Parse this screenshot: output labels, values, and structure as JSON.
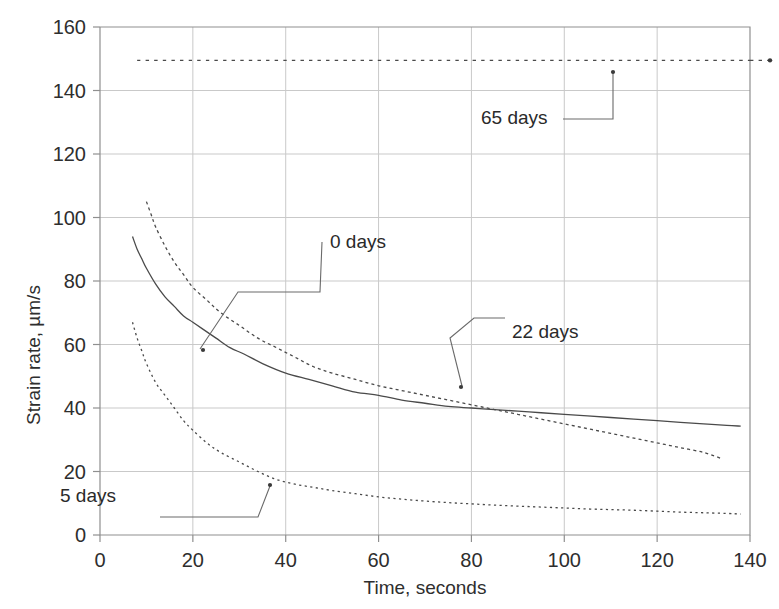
{
  "chart_data": {
    "type": "line",
    "title": "",
    "xlabel": "Time, seconds",
    "ylabel": "Strain rate, µm/s",
    "xlim": [
      0,
      140
    ],
    "ylim": [
      0,
      160
    ],
    "xticks": [
      0,
      20,
      40,
      60,
      80,
      100,
      120,
      140
    ],
    "yticks": [
      0,
      20,
      40,
      60,
      80,
      100,
      120,
      140,
      160
    ],
    "grid": true,
    "legend": "inline-annotations",
    "series": [
      {
        "name": "0 days",
        "style": "solid",
        "x": [
          7,
          8,
          9,
          10,
          12,
          14,
          16,
          18,
          20,
          22,
          25,
          28,
          31,
          35,
          40,
          45,
          50,
          55,
          60,
          65,
          70,
          75,
          80,
          85,
          90,
          95,
          100,
          105,
          110,
          115,
          120,
          125,
          130,
          135,
          138
        ],
        "y": [
          94,
          90,
          87,
          84,
          79,
          75,
          72,
          69,
          67,
          65,
          62,
          59,
          57,
          54,
          51,
          49,
          47,
          45,
          44,
          42.5,
          41.5,
          40.5,
          40,
          39.5,
          39,
          38.5,
          38,
          37.5,
          37,
          36.5,
          36,
          35.5,
          35,
          34.5,
          34.3
        ]
      },
      {
        "name": "22 days",
        "style": "dashed",
        "x": [
          10,
          11,
          12,
          14,
          16,
          18,
          20,
          23,
          26,
          30,
          34,
          38,
          42,
          46,
          50,
          55,
          60,
          65,
          70,
          75,
          80,
          85,
          90,
          95,
          100,
          105,
          110,
          115,
          120,
          125,
          130,
          134
        ],
        "y": [
          105,
          101,
          97,
          91,
          86,
          82,
          78,
          74,
          70,
          66,
          62,
          59,
          56,
          53,
          51,
          49,
          47,
          45.5,
          44,
          42.5,
          41,
          39.5,
          38,
          36.5,
          35,
          33.5,
          32,
          30.5,
          29,
          27.5,
          26,
          24
        ]
      },
      {
        "name": "5 days",
        "style": "dotted",
        "x": [
          7,
          8,
          9,
          10,
          12,
          14,
          16,
          18,
          20,
          23,
          26,
          30,
          34,
          38,
          42,
          46,
          50,
          55,
          60,
          65,
          70,
          75,
          80,
          85,
          90,
          95,
          100,
          105,
          110,
          115,
          120,
          125,
          130,
          135,
          138
        ],
        "y": [
          67,
          62,
          58,
          54,
          48,
          44,
          40,
          36,
          33,
          29,
          26,
          23,
          20,
          17.5,
          16,
          15,
          14,
          13,
          12,
          11.3,
          10.7,
          10.2,
          9.8,
          9.4,
          9.1,
          8.8,
          8.5,
          8.2,
          8,
          7.8,
          7.5,
          7.2,
          7,
          6.8,
          6.6
        ]
      },
      {
        "name": "65 days",
        "style": "dotted-flat",
        "x": [
          8,
          140
        ],
        "y": [
          149.5,
          149.5
        ]
      }
    ],
    "annotations": [
      {
        "label": "0 days",
        "label_x": 330,
        "label_y": 248,
        "anchor_x": 203,
        "anchor_y": 350,
        "leader": "M 200,349 L 238,292 L 290,292 L 320,292 L 322,242"
      },
      {
        "label": "22 days",
        "label_x": 512,
        "label_y": 338,
        "anchor_x": 461,
        "anchor_y": 387,
        "leader": "M 462,386 L 450,338 L 474,318 L 505,318"
      },
      {
        "label": "65 days",
        "label_x": 481,
        "label_y": 124,
        "anchor_x": 613,
        "anchor_y": 72,
        "leader": "M 613,73 L 613,119 L 563,119"
      },
      {
        "label": "5 days",
        "label_x": 60,
        "label_y": 502,
        "anchor_x": 270,
        "anchor_y": 485,
        "leader": "M 270,486 L 258,517 L 220,517 L 160,517"
      }
    ]
  },
  "axes": {
    "x_tick_labels": [
      "0",
      "20",
      "40",
      "60",
      "80",
      "100",
      "120",
      "140"
    ],
    "y_tick_labels": [
      "0",
      "20",
      "40",
      "60",
      "80",
      "100",
      "120",
      "140",
      "160"
    ],
    "x_axis_title": "Time, seconds",
    "y_axis_title": "Strain rate, µm/s"
  },
  "colors": {
    "background": "#ffffff",
    "grid": "#c9c9c9",
    "frame": "#8f8f8f",
    "curve": "#4a4a4a",
    "text": "#2e2e2e"
  }
}
